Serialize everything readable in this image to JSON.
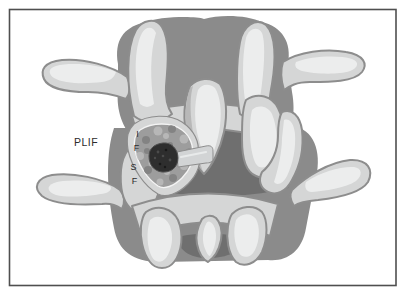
{
  "labels": {
    "plif": "PLIF",
    "if": [
      "I",
      "F"
    ],
    "sf": [
      "S",
      "F"
    ]
  },
  "colors": {
    "frame-line": "#4f4f4f",
    "backdrop": "#8b8b8b",
    "canal": "#6f6f6f",
    "bone": "#d5d6d6",
    "bone-edge": "#8d8d8d",
    "highlight": "#eef0f0",
    "midshadow": "#b0b0b0",
    "graft-base": "#9d9d9d",
    "speckle-dark": "#7f7f7f",
    "speckle-light": "#bcbcbc",
    "window-rim": "#f4f4f4",
    "hole": "#2e2e2e",
    "hole-edge": "#4f4f4f",
    "tab": "#d2d4d5",
    "text": "#2c2c2c"
  }
}
